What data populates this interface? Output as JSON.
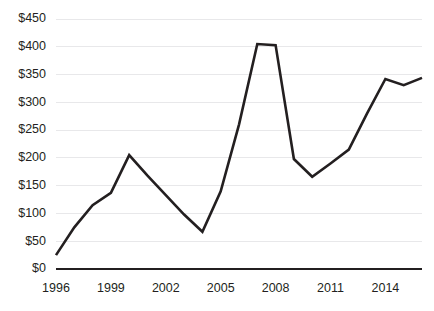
{
  "chart_data": {
    "type": "line",
    "title": "",
    "subtitle": "",
    "xlabel": "",
    "ylabel": "",
    "x": [
      1996,
      1997,
      1998,
      1999,
      2000,
      2001,
      2002,
      2003,
      2004,
      2005,
      2006,
      2007,
      2008,
      2009,
      2010,
      2011,
      2012,
      2013,
      2014,
      2015,
      2016
    ],
    "series": [
      {
        "name": "Value",
        "values": [
          25,
          75,
          115,
          137,
          205,
          168,
          133,
          98,
          67,
          140,
          260,
          405,
          403,
          198,
          166,
          190,
          215,
          280,
          342,
          331,
          344
        ]
      }
    ],
    "y_ticks": [
      0,
      50,
      100,
      150,
      200,
      250,
      300,
      350,
      400,
      450
    ],
    "y_tick_labels": [
      "$0",
      "$50",
      "$100",
      "$150",
      "$200",
      "$250",
      "$300",
      "$350",
      "$400",
      "$450"
    ],
    "x_ticks": [
      1996,
      1999,
      2002,
      2005,
      2008,
      2011,
      2014
    ],
    "x_tick_labels": [
      "1996",
      "1999",
      "2002",
      "2005",
      "2008",
      "2011",
      "2014"
    ],
    "ylim": [
      0,
      450
    ],
    "xlim": [
      1996,
      2016
    ],
    "grid": true,
    "grid_axis": "y",
    "legend": false,
    "legend_position": "none",
    "colors": {
      "line": "#231f20",
      "grid": "#e8e8ea",
      "axis": "#231f20",
      "text": "#231f20",
      "background": "#ffffff"
    },
    "annotations": []
  },
  "plot_geometry": {
    "left": 56,
    "right": 422,
    "top": 19,
    "bottom": 269
  }
}
